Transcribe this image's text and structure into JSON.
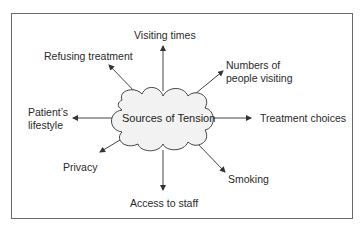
{
  "diagram": {
    "center": "Sources of Tension",
    "nodes": {
      "visiting_times": "Visiting times",
      "refusing_treatment": "Refusing treatment",
      "numbers_line1": "Numbers of",
      "numbers_line2": "people visiting",
      "patients_line1": "Patient’s",
      "patients_line2": "lifestyle",
      "treatment_choices": "Treatment choices",
      "privacy": "Privacy",
      "smoking": "Smoking",
      "access_to_staff": "Access to staff"
    },
    "colors": {
      "cloud_fill": "#f2f2f2",
      "stroke": "#444444",
      "border": "#6a6a6a"
    }
  }
}
